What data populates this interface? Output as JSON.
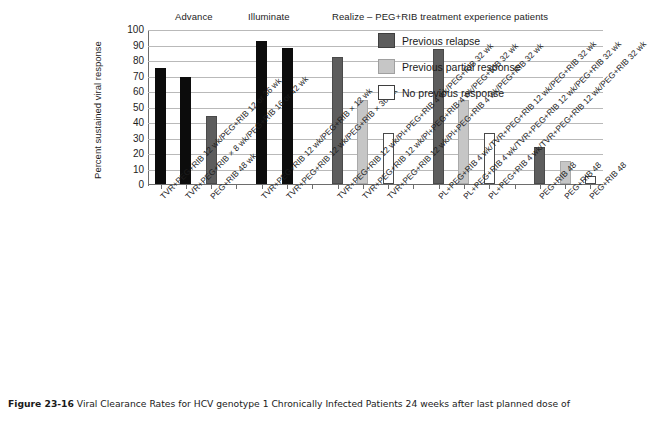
{
  "figure": {
    "caption_label": "Figure 23-16",
    "caption_text": "Viral Clearance Rates for HCV genotype 1 Chronically Infected Patients 24 weeks after last planned dose of"
  },
  "legend": {
    "position": "top-right",
    "items": [
      {
        "label": "Previous relapse",
        "swatch": "dark",
        "color": "#5d5d5d"
      },
      {
        "label": "Previous partial response",
        "swatch": "light",
        "color": "#c6c6c6"
      },
      {
        "label": "No previous response",
        "swatch": "white",
        "color": "#ffffff"
      }
    ]
  },
  "groups": [
    {
      "label": "Advance"
    },
    {
      "label": "Illuminate"
    },
    {
      "label": "Realize – PEG+RIB treatment experience patients"
    }
  ],
  "chart_data": {
    "type": "bar",
    "title": "",
    "xlabel": "",
    "ylabel": "Percent sustained viral response",
    "ylim": [
      0,
      100
    ],
    "yticks": [
      0,
      10,
      20,
      30,
      40,
      50,
      60,
      70,
      80,
      90,
      100
    ],
    "grid": true,
    "categories": [
      "TVR+PEG+RIB 12 wk/PEG+RIB 12 or 36 wk",
      "TVR+PEG+RIB × 8 wk/PEG+RIB 16 or 42 wk",
      "PEG+RIB 48 wk",
      "TVR+PEG+RIB 12 wk/PEG+RIB × 12 wk",
      "TVR+PEG+RIB 12 wk/PEG+RIB × 36 wk",
      "TVR+PEG+RIB 12 wk/Pl+PEG+RIB 4 wk/PEG+RIB 32 wk",
      "TVR+PEG+RIB 12 wk/Pl+PEG+RIB 4 wk/PEG+RIB 32 wk",
      "TVR+PEG+RIB 12 wk/Pl+PEG+RIB 4 wk/PEG+RIB 32 wk",
      "PL+PEG+RIB 4 wk/TVR+PEG+RIB 12 wk/PEG+RIB 32 wk",
      "PL+PEG+RIB 4 wk/TVR+PEG+RIB 12 wk/PEG+RIB 32 wk",
      "PL+PEG+RIB 4 wk/TVR+PEG+RIB 12 wk/PEG+RIB 32 wk",
      "PEG+RIB 48",
      "PEG+RIB 48",
      "PEG+RIB 48"
    ],
    "values": [
      75,
      69,
      44,
      92,
      88,
      82,
      54,
      33,
      87,
      54,
      33,
      24,
      15,
      5
    ],
    "bar_styles": [
      "black",
      "black",
      "dark",
      "black",
      "black",
      "dark",
      "light",
      "white",
      "dark",
      "light",
      "white",
      "dark",
      "light",
      "white"
    ],
    "slots": [
      0,
      1,
      2,
      4,
      5,
      7,
      8,
      9,
      11,
      12,
      13,
      15,
      16,
      17
    ],
    "n_slots": 18
  }
}
